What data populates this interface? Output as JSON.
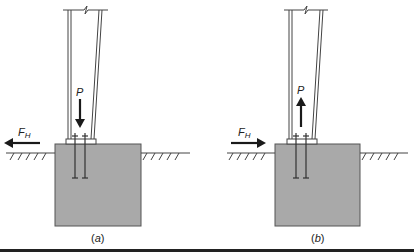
{
  "figure": {
    "panels": [
      {
        "id": "a",
        "caption": "(a)",
        "caption_letter": "a",
        "axial_load": {
          "label": "P",
          "direction": "down"
        },
        "horizontal_load": {
          "label": "F",
          "subscript": "H",
          "direction": "left"
        }
      },
      {
        "id": "b",
        "caption": "(b)",
        "caption_letter": "b",
        "axial_load": {
          "label": "P",
          "direction": "up"
        },
        "horizontal_load": {
          "label": "F",
          "subscript": "H",
          "direction": "right"
        }
      }
    ],
    "colors": {
      "footing_fill": "#a9a9a9",
      "line": "#333333",
      "arrow": "#1a1a1a",
      "bottom_rule": "#222222"
    }
  }
}
